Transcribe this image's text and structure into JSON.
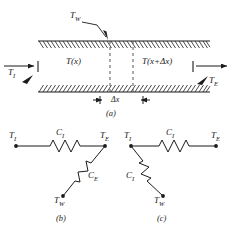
{
  "figure": {
    "panels": [
      {
        "id": "a",
        "caption": "(a)",
        "type": "duct-control-volume",
        "labels": {
          "wall_temp": "T",
          "wall_temp_sub": "W",
          "inlet_temp": "T",
          "inlet_temp_sub": "I",
          "exit_temp": "T",
          "exit_temp_sub": "E",
          "section_left": "T(x)",
          "section_right": "T(x+Δx)",
          "element_width": "Δx"
        }
      },
      {
        "id": "b",
        "caption": "(b)",
        "type": "thermal-network",
        "nodes": [
          {
            "name": "T",
            "sub": "I",
            "position": "left"
          },
          {
            "name": "T",
            "sub": "E",
            "position": "right"
          },
          {
            "name": "T",
            "sub": "W",
            "position": "bottom"
          }
        ],
        "resistors": [
          {
            "label": "C",
            "sub": "I",
            "between": "T_I-T_E",
            "orientation": "horizontal"
          },
          {
            "label": "C",
            "sub": "E",
            "between": "T_E-T_W",
            "orientation": "diagonal"
          }
        ]
      },
      {
        "id": "c",
        "caption": "(c)",
        "type": "thermal-network",
        "nodes": [
          {
            "name": "T",
            "sub": "I",
            "position": "left"
          },
          {
            "name": "T",
            "sub": "E",
            "position": "right"
          },
          {
            "name": "T",
            "sub": "W",
            "position": "bottom"
          }
        ],
        "resistors": [
          {
            "label": "C",
            "sub": "I",
            "between": "T_I-T_E",
            "orientation": "horizontal"
          },
          {
            "label": "C",
            "sub": "I",
            "between": "T_I-T_W",
            "orientation": "diagonal"
          }
        ]
      }
    ],
    "colors": {
      "line": "#1b1b1b",
      "background": "#ffffff",
      "hatch": "#1b1b1b",
      "dashed": "#555555"
    }
  }
}
